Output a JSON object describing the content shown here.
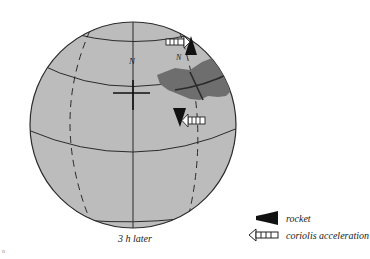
{
  "diagram": {
    "caption": "3 h later",
    "north_pole_label": "N",
    "launch_site_label": "N",
    "colors": {
      "globe_fill": "#bcbcbc",
      "land_fill": "#6e6e6e",
      "line": "#2a2a2a",
      "rocket": "#111111"
    }
  },
  "legend": {
    "items": [
      {
        "icon": "rocket-icon",
        "label": "rocket"
      },
      {
        "icon": "coriolis-arrow-icon",
        "label": "coriolis acceleration"
      }
    ]
  },
  "stray_mark": "n"
}
